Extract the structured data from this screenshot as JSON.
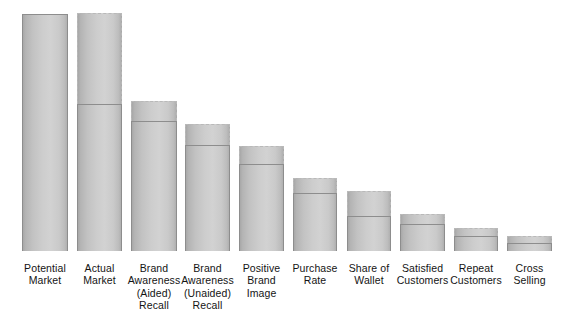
{
  "chart_data": {
    "type": "bar",
    "title": "",
    "subtitle": "",
    "xlabel": "",
    "ylabel": "",
    "grid": false,
    "legend": null,
    "axis_visible": false,
    "value_scale_note": "Values are relative percentages of the Potential Market (leftmost bar = 100). Each stage shows an achieved level (solid-outlined lower block) and an unrealized potential gap (dashed-outlined upper block) up to the previous stage's level.",
    "ylim": [
      0,
      100
    ],
    "categories": [
      "Potential Market",
      "Actual Market",
      "Brand Awareness (Aided) Recall",
      "Brand Awareness (Unaided) Recall",
      "Positive Brand Image",
      "Purchase Rate",
      "Share of Wallet",
      "Satisfied Customers",
      "Repeat Customers",
      "Cross Selling"
    ],
    "series": [
      {
        "name": "Achieved",
        "values": [
          100,
          62,
          55,
          45,
          37,
          25,
          15,
          11,
          6,
          3
        ]
      },
      {
        "name": "Potential gap",
        "values": [
          0,
          38,
          8,
          9,
          8,
          6,
          10,
          4,
          3,
          3
        ]
      }
    ],
    "total_height": [
      100,
      100,
      63,
      54,
      44,
      31,
      25,
      16,
      10,
      6
    ]
  },
  "chart": {
    "colors": {
      "bar_fill_dark": "#a8a8a8",
      "bar_fill_light": "#d2d2d2",
      "solid_border": "#8d8d8d",
      "dashed_border": "#b9b9b9",
      "background": "#ffffff",
      "label_text": "#141414"
    },
    "bars": [
      {
        "name": "potential-market",
        "label_lines": [
          "Potential",
          "Market"
        ],
        "left": 22,
        "width": 46,
        "potential_top": null,
        "actual_top": 14,
        "baseline": 251,
        "outline": "solid"
      },
      {
        "name": "actual-market",
        "label_lines": [
          "Actual",
          "Market"
        ],
        "left": 77,
        "width": 45,
        "potential_top": 13,
        "actual_top": 104,
        "baseline": 251,
        "outline": "dashed-cap"
      },
      {
        "name": "brand-awareness-aided-recall",
        "label_lines": [
          "Brand",
          "Awareness",
          "(Aided)",
          "Recall"
        ],
        "left": 131,
        "width": 46,
        "potential_top": 101,
        "actual_top": 121,
        "baseline": 251,
        "outline": "dashed-cap"
      },
      {
        "name": "brand-awareness-unaided-recall",
        "label_lines": [
          "Brand",
          "Awareness",
          "(Unaided)",
          "Recall"
        ],
        "left": 185,
        "width": 45,
        "potential_top": 124,
        "actual_top": 145,
        "baseline": 251,
        "outline": "dashed-cap"
      },
      {
        "name": "positive-brand-image",
        "label_lines": [
          "Positive",
          "Brand",
          "Image"
        ],
        "left": 239,
        "width": 45,
        "potential_top": 146,
        "actual_top": 164,
        "baseline": 251,
        "outline": "dashed-cap"
      },
      {
        "name": "purchase-rate",
        "label_lines": [
          "Purchase",
          "Rate"
        ],
        "left": 293,
        "width": 44,
        "potential_top": 178,
        "actual_top": 193,
        "baseline": 251,
        "outline": "dashed-cap"
      },
      {
        "name": "share-of-wallet",
        "label_lines": [
          "Share of",
          "Wallet"
        ],
        "left": 347,
        "width": 44,
        "potential_top": 191,
        "actual_top": 216,
        "baseline": 251,
        "outline": "dashed-cap"
      },
      {
        "name": "satisfied-customers",
        "label_lines": [
          "Satisfied",
          "Customers"
        ],
        "left": 400,
        "width": 45,
        "potential_top": 214,
        "actual_top": 224,
        "baseline": 251,
        "outline": "dashed-cap"
      },
      {
        "name": "repeat-customers",
        "label_lines": [
          "Repeat",
          "Customers"
        ],
        "left": 454,
        "width": 44,
        "potential_top": 228,
        "actual_top": 236,
        "baseline": 251,
        "outline": "dashed-cap"
      },
      {
        "name": "cross-selling",
        "label_lines": [
          "Cross",
          "Selling"
        ],
        "left": 507,
        "width": 45,
        "potential_top": 236,
        "actual_top": 243,
        "baseline": 251,
        "outline": "dashed-cap"
      }
    ]
  }
}
